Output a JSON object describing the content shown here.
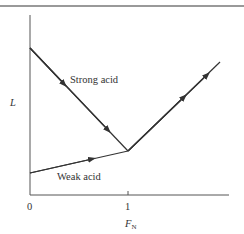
{
  "figure": {
    "y_axis_label": "L",
    "x_axis_label": "F",
    "x_axis_label_subscript": "N",
    "x_ticks": [
      {
        "label": "0",
        "value": 0
      },
      {
        "label": "1",
        "value": 1
      }
    ],
    "curves": [
      {
        "name": "Strong acid",
        "label": "Strong acid",
        "direction": "decreasing to equivalence point"
      },
      {
        "name": "Weak acid",
        "label": "Weak acid",
        "direction": "increasing slowly to equivalence point"
      },
      {
        "name": "Excess titrant",
        "label": "",
        "direction": "increasing after equivalence point"
      }
    ],
    "colors": {
      "line": "#333333",
      "rule": "#777777",
      "background": "#ffffff"
    }
  }
}
